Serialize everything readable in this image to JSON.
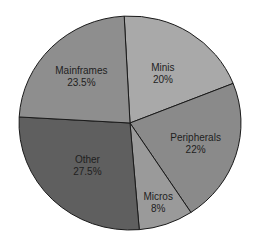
{
  "chart_data": {
    "type": "pie",
    "title": "",
    "categories": [
      "Minis",
      "Peripherals",
      "Micros",
      "Other",
      "Mainframes"
    ],
    "values": [
      20,
      22,
      8,
      27.5,
      23.5
    ],
    "value_labels": [
      "20%",
      "22%",
      "8%",
      "27.5%",
      "23.5%"
    ],
    "colors": [
      "#a9a9a9",
      "#8a8a8a",
      "#9a9a9a",
      "#5f5f5f",
      "#8e8e8e"
    ],
    "legend": "none (labels inside slices)",
    "start_angle_deg_clockwise_from_top": -3,
    "direction": "clockwise"
  }
}
